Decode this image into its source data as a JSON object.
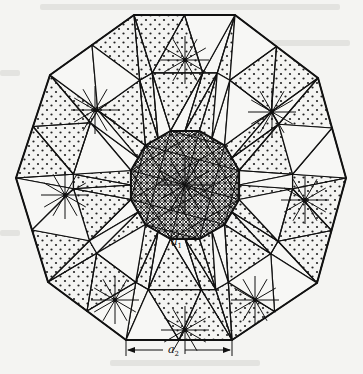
{
  "figure": {
    "colors": {
      "background": "#f4f4f2",
      "line": "#111111",
      "stipple": "#222222"
    },
    "outer_polygon": [
      [
        134,
        15
      ],
      [
        235,
        15
      ],
      [
        318,
        78
      ],
      [
        346,
        178
      ],
      [
        317,
        283
      ],
      [
        232,
        340
      ],
      [
        126,
        340
      ],
      [
        48,
        282
      ],
      [
        16,
        178
      ],
      [
        50,
        75
      ]
    ],
    "inner_center": [
      185,
      185
    ],
    "inner_radius": 56,
    "labels": {
      "a1": {
        "base": "a",
        "sub": "1",
        "x": 171,
        "y": 238
      },
      "a2": {
        "base": "a",
        "sub": "2",
        "x": 171,
        "y": 346
      }
    },
    "dimension_a2": {
      "x1": 126,
      "x2": 232,
      "y": 350
    }
  }
}
